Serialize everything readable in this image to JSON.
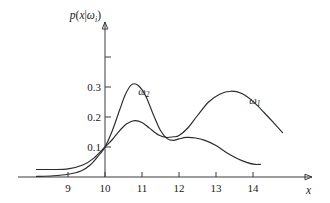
{
  "chart_data": {
    "type": "line",
    "title": "",
    "subtitle": "",
    "xlabel": "x",
    "ylabel": "p(x|ωi)",
    "ylabel_parts": {
      "func": "p",
      "open": "(",
      "var": "x",
      "bar": "|",
      "omega": "ω",
      "sub": "i",
      "close": ")"
    },
    "xlim": [
      8.0,
      15.0
    ],
    "ylim": [
      0.0,
      0.42
    ],
    "grid": false,
    "legend_position": "inline-annotation",
    "x_ticks": [
      9,
      10,
      11,
      12,
      13,
      14
    ],
    "x_tick_labels": [
      "9",
      "10",
      "11",
      "12",
      "13",
      "14"
    ],
    "y_ticks": [
      0.1,
      0.2,
      0.3,
      0.4
    ],
    "y_tick_labels": [
      "0.1",
      "0.2",
      "0.3",
      ""
    ],
    "axis_arrows": [
      "x-right",
      "y-up"
    ],
    "annotations": [
      {
        "text": "ω2",
        "omega": "ω",
        "sub": "2",
        "x": 11.05,
        "y": 0.275
      },
      {
        "text": "ω1",
        "omega": "ω",
        "sub": "1",
        "x": 14.05,
        "y": 0.245
      }
    ],
    "series": [
      {
        "name": "ω2",
        "label_omega": "ω",
        "label_sub": "2",
        "x": [
          8.15,
          8.6,
          9.0,
          9.35,
          9.6,
          9.85,
          10.0,
          10.2,
          10.4,
          10.55,
          10.72,
          10.9,
          11.1,
          11.3,
          11.5,
          11.68,
          11.85,
          12.0,
          12.2,
          12.45,
          12.7,
          13.0,
          13.3,
          13.6,
          13.85,
          14.05,
          14.2
        ],
        "y": [
          0.002,
          0.004,
          0.009,
          0.02,
          0.04,
          0.075,
          0.1,
          0.155,
          0.225,
          0.275,
          0.308,
          0.305,
          0.27,
          0.21,
          0.155,
          0.128,
          0.122,
          0.127,
          0.132,
          0.13,
          0.122,
          0.105,
          0.08,
          0.06,
          0.048,
          0.042,
          0.042
        ]
      },
      {
        "name": "ω1",
        "label_omega": "ω",
        "label_sub": "1",
        "x": [
          8.15,
          8.6,
          9.0,
          9.4,
          9.7,
          10.0,
          10.2,
          10.4,
          10.6,
          10.8,
          11.0,
          11.2,
          11.45,
          11.65,
          11.85,
          12.0,
          12.25,
          12.5,
          12.8,
          13.1,
          13.4,
          13.7,
          14.0,
          14.3,
          14.6,
          14.8
        ],
        "y": [
          0.025,
          0.025,
          0.027,
          0.04,
          0.063,
          0.1,
          0.125,
          0.155,
          0.178,
          0.188,
          0.182,
          0.163,
          0.14,
          0.132,
          0.134,
          0.138,
          0.165,
          0.205,
          0.25,
          0.276,
          0.286,
          0.278,
          0.252,
          0.215,
          0.175,
          0.148
        ]
      }
    ]
  },
  "figure": {
    "background_color": "#ffffff",
    "curve_color": "#2b2b2b",
    "axis_color": "#3a3a3a",
    "text_color": "#1a1a1a"
  }
}
